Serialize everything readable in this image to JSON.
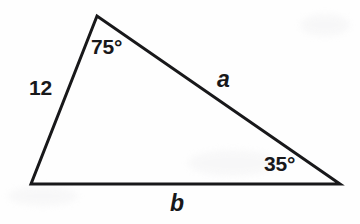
{
  "figure": {
    "type": "geometry-diagram",
    "background_color": "#fefefe",
    "stroke_color": "#18181a",
    "text_color": "#18181a",
    "stroke_width": 3,
    "canvas": {
      "width": 360,
      "height": 224
    }
  },
  "shape": {
    "name": "triangle",
    "vertices": [
      {
        "id": "top",
        "name": "apex-vertex",
        "x": 97,
        "y": 16
      },
      {
        "id": "bottom_left",
        "name": "bottom-left-vertex",
        "x": 31,
        "y": 184
      },
      {
        "id": "bottom_right",
        "name": "bottom-right-vertex",
        "x": 340,
        "y": 184
      }
    ],
    "path": "M 97 16 L 340 184 L 31 184 Z"
  },
  "labels": {
    "angle_top": {
      "text": "75°",
      "value": 75,
      "unit": "degrees",
      "at_vertex": "top"
    },
    "angle_bottom_right": {
      "text": "35°",
      "value": 35,
      "unit": "degrees",
      "at_vertex": "bottom_right"
    },
    "side_left": {
      "text": "12",
      "value": 12,
      "between": [
        "top",
        "bottom_left"
      ],
      "style": "upright"
    },
    "side_a": {
      "text": "a",
      "between": [
        "top",
        "bottom_right"
      ],
      "style": "italic"
    },
    "side_b": {
      "text": "b",
      "between": [
        "bottom_left",
        "bottom_right"
      ],
      "style": "italic"
    }
  }
}
